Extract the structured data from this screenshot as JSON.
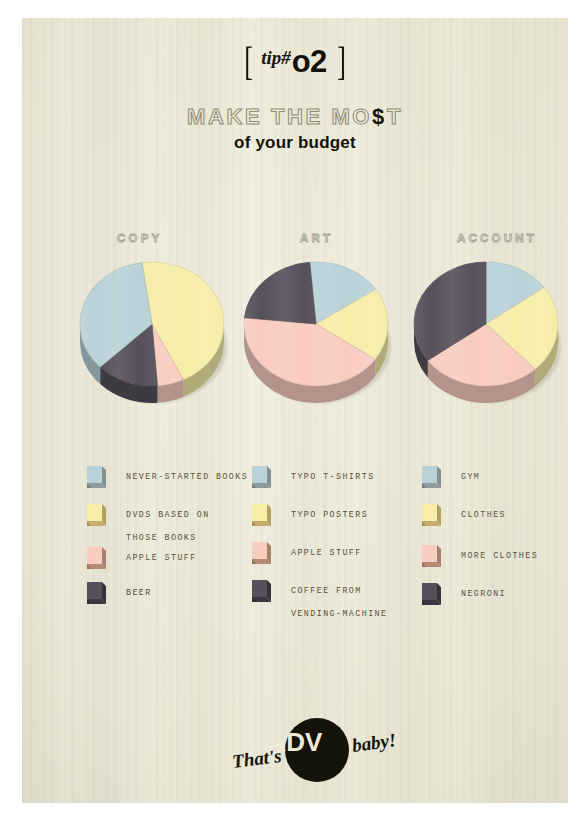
{
  "poster": {
    "tip_bracket_left": "[",
    "tip_bracket_right": "]",
    "tip_prefix": "tip#",
    "tip_number": "o2",
    "headline_pre": "MAKE THE MO",
    "headline_dollar": "$",
    "headline_post": "T",
    "subhead": "of your budget",
    "background_color": "#e9e6d6"
  },
  "palette": {
    "blue": "#b9d2d8",
    "blue_side": "#8f9c9d",
    "yellow": "#f6eda8",
    "yellow_side": "#c5ae6c",
    "pink": "#f9ccc0",
    "pink_side": "#b38b74",
    "dark": "#55505a",
    "dark_side": "#3b363f",
    "title_stroke": "#a5a294",
    "label_color": "#55523f"
  },
  "columns": [
    {
      "id": "copy",
      "title": "COPY",
      "legend": [
        {
          "color_key": "blue",
          "label_lines": [
            "NEVER-STARTED BOOKS"
          ]
        },
        {
          "color_key": "yellow",
          "label_lines": [
            "DVDS BASED ON",
            "THOSE BOOKS"
          ]
        },
        {
          "color_key": "pink",
          "label_lines": [
            "APPLE STUFF"
          ]
        },
        {
          "color_key": "dark",
          "label_lines": [
            "BEER"
          ]
        }
      ]
    },
    {
      "id": "art",
      "title": "ART",
      "legend": [
        {
          "color_key": "blue",
          "label_lines": [
            "TYPO T-SHIRTS"
          ]
        },
        {
          "color_key": "yellow",
          "label_lines": [
            "TYPO POSTERS"
          ]
        },
        {
          "color_key": "pink",
          "label_lines": [
            "APPLE STUFF"
          ]
        },
        {
          "color_key": "dark",
          "label_lines": [
            "COFFEE FROM",
            "VENDING-MACHINE"
          ]
        }
      ]
    },
    {
      "id": "account",
      "title": "ACCOUNT",
      "legend": [
        {
          "color_key": "blue",
          "label_lines": [
            "GYM"
          ]
        },
        {
          "color_key": "yellow",
          "label_lines": [
            "CLOTHES"
          ]
        },
        {
          "color_key": "pink",
          "label_lines": [
            "MORE CLOTHES"
          ]
        },
        {
          "color_key": "dark",
          "label_lines": [
            "NEGRONI"
          ]
        }
      ]
    }
  ],
  "chart_data": [
    {
      "type": "pie",
      "title": "COPY",
      "categories": [
        "DVDS BASED ON THOSE BOOKS",
        "APPLE STUFF",
        "BEER",
        "NEVER-STARTED BOOKS"
      ],
      "values": [
        45,
        6,
        14,
        35
      ],
      "colors": [
        "#f6eda8",
        "#f9ccc0",
        "#55505a",
        "#b9d2d8"
      ],
      "start_angle": -8,
      "legend_position": "below"
    },
    {
      "type": "pie",
      "title": "ART",
      "categories": [
        "TYPO T-SHIRTS",
        "TYPO POSTERS",
        "APPLE STUFF",
        "COFFEE FROM VENDING-MACHINE"
      ],
      "values": [
        17,
        19,
        42,
        22
      ],
      "colors": [
        "#b9d2d8",
        "#f6eda8",
        "#f9ccc0",
        "#55505a"
      ],
      "start_angle": -5,
      "legend_position": "below"
    },
    {
      "type": "pie",
      "title": "ACCOUNT",
      "categories": [
        "GYM",
        "CLOTHES",
        "MORE CLOTHES",
        "NEGRONI"
      ],
      "values": [
        15,
        23,
        27,
        35
      ],
      "colors": [
        "#b9d2d8",
        "#f6eda8",
        "#f9ccc0",
        "#55505a"
      ],
      "start_angle": 0,
      "legend_position": "below"
    }
  ],
  "footer": {
    "thats": "That's",
    "adv": "ADV",
    "baby": "baby!"
  }
}
